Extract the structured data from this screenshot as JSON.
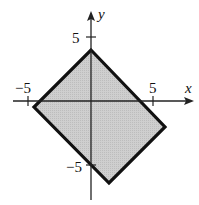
{
  "diagram": {
    "type": "region-plot",
    "axes": {
      "x_label": "x",
      "y_label": "y",
      "x_ticks": [
        {
          "value": -5,
          "label": "−5"
        },
        {
          "value": 5,
          "label": "5"
        }
      ],
      "y_ticks": [
        {
          "value": 5,
          "label": "5"
        },
        {
          "value": -5,
          "label": "−5"
        }
      ]
    },
    "region": {
      "shape": "rectangle (rotated square)",
      "vertices": [
        [
          0,
          4
        ],
        [
          7,
          -2
        ],
        [
          1.5,
          -7
        ],
        [
          -4.5,
          -0.5
        ]
      ],
      "fill": "#c8c8c8",
      "stroke": "#111111"
    }
  }
}
